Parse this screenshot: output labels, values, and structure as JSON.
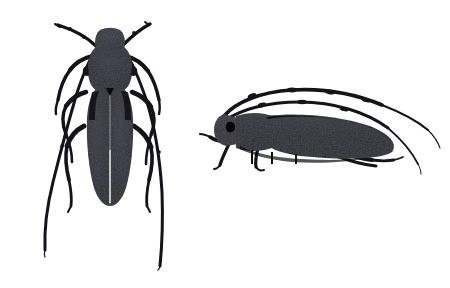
{
  "image": {
    "kind": "natural-image",
    "subject": "longhorn-beetle-specimen-plate",
    "title": "Longhorn beetle specimen plate",
    "background_color": "#ffffff",
    "ink_color": "#111111",
    "width": 450,
    "height": 288,
    "specimen_count": 2,
    "visible_text": ""
  },
  "specimens": [
    {
      "id": "dorsal",
      "label": "Dorsal view beetle",
      "view": "dorsal",
      "position": {
        "x": 25,
        "y": 14,
        "width": 170,
        "height": 262
      },
      "body": {
        "head_label": "head",
        "pronotum_label": "pronotum",
        "elytra_label": "elytra",
        "elytra_texture": "mottled-speckled",
        "elytra_suture": "visible-central-suture",
        "body_color": "#15141a",
        "body_length_px": 175
      },
      "antennae": {
        "count": 2,
        "segments_visible": 7,
        "sweep": "backward-outward",
        "tip_left": {
          "x": 46,
          "y": 252
        },
        "tip_right": {
          "x": 160,
          "y": 268
        },
        "origin_left": {
          "x": 96,
          "y": 44
        },
        "origin_right": {
          "x": 122,
          "y": 44
        },
        "tip_top_left": {
          "x": 56,
          "y": 24
        },
        "tip_top_right": {
          "x": 148,
          "y": 22
        }
      },
      "legs": {
        "count": 6,
        "arrangement": "three-pairs-lateral"
      }
    },
    {
      "id": "lateral",
      "label": "Lateral view beetle",
      "view": "lateral",
      "position": {
        "x": 200,
        "y": 78,
        "width": 240,
        "height": 100
      },
      "body": {
        "head_label": "head",
        "pronotum_label": "pronotum",
        "elytra_label": "elytra",
        "elytra_texture": "mottled-speckled",
        "body_color": "#15141a",
        "body_length_px": 180,
        "facing": "left"
      },
      "antennae": {
        "count": 2,
        "segments_visible": 8,
        "sweep": "arching-back-over-body",
        "origin": {
          "x": 225,
          "y": 112
        },
        "tip_upper": {
          "x": 432,
          "y": 108
        },
        "tip_lower": {
          "x": 418,
          "y": 168
        }
      },
      "legs": {
        "count": 4,
        "arrangement": "visible-left-side-pairs"
      }
    }
  ]
}
